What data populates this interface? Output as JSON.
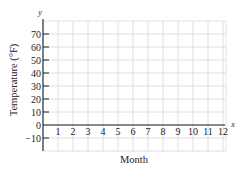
{
  "chart_data": {
    "type": "line",
    "title": "",
    "xlabel": "Month",
    "ylabel": "Temperature (°F)",
    "x_axis_name": "x",
    "y_axis_name": "y",
    "x_ticks": [
      "1",
      "2",
      "3",
      "4",
      "5",
      "6",
      "7",
      "8",
      "9",
      "10",
      "11",
      "12"
    ],
    "y_ticks": [
      "70",
      "60",
      "50",
      "40",
      "30",
      "20",
      "10",
      "0",
      "−10"
    ],
    "y_tick_values": [
      70,
      60,
      50,
      40,
      30,
      20,
      10,
      0,
      -10
    ],
    "xlim": [
      0,
      12
    ],
    "ylim": [
      -20,
      80
    ],
    "grid": true,
    "series": [],
    "legend": null
  }
}
